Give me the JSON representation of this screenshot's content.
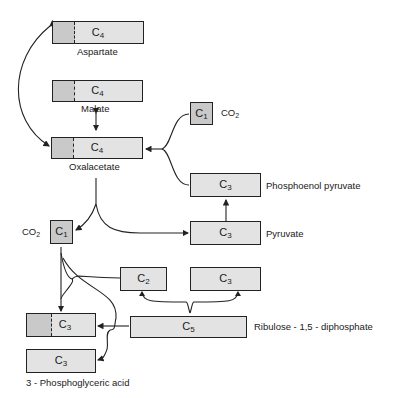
{
  "diagram": {
    "type": "C4 photosynthesis pathway",
    "nodes": {
      "aspartate": {
        "carbon": "C",
        "n": "4",
        "name": "Aspartate"
      },
      "malate": {
        "carbon": "C",
        "n": "4",
        "name": "Malate"
      },
      "oxalacetate": {
        "carbon": "C",
        "n": "4",
        "name": "Oxalacetate"
      },
      "co2_top": {
        "carbon": "C",
        "n": "1",
        "name_main": "CO",
        "name_sub": "2"
      },
      "pep": {
        "carbon": "C",
        "n": "3",
        "name": "Phosphoenol pyruvate"
      },
      "pyruvate": {
        "carbon": "C",
        "n": "3",
        "name": "Pyruvate"
      },
      "co2_left": {
        "carbon": "C",
        "n": "1",
        "name_main": "CO",
        "name_sub": "2"
      },
      "c2": {
        "carbon": "C",
        "n": "2"
      },
      "c3_right": {
        "carbon": "C",
        "n": "3"
      },
      "pga1": {
        "carbon": "C",
        "n": "3"
      },
      "pga2": {
        "carbon": "C",
        "n": "3"
      },
      "rubp": {
        "carbon": "C",
        "n": "5",
        "name": "Ribulose - 1,5 - diphosphate"
      },
      "pga_label": "3 - Phosphoglyceric acid"
    },
    "colors": {
      "shaded": "#c9c9c9",
      "light": "#e3e3e3",
      "line": "#222222"
    }
  }
}
